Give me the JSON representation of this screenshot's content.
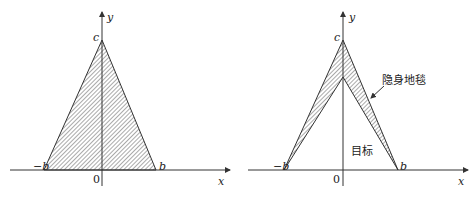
{
  "figures": [
    {
      "id": "left",
      "description": "Solid triangle target with vertices (-b,0), (b,0), (0,c)",
      "labels": {
        "y_axis": "y",
        "x_axis": "x",
        "apex": "c",
        "left_base": "−b",
        "right_base": "b",
        "origin": "0"
      }
    },
    {
      "id": "right",
      "description": "Triangle target wrapped by stealth carpet (hatched shell)",
      "labels": {
        "y_axis": "y",
        "x_axis": "x",
        "apex": "c",
        "left_base": "−b",
        "right_base": "b",
        "origin": "0",
        "carpet": "隐身地毯",
        "target": "目标"
      }
    }
  ],
  "colors": {
    "line": "#333333",
    "hatch": "#555555",
    "background": "#ffffff"
  }
}
